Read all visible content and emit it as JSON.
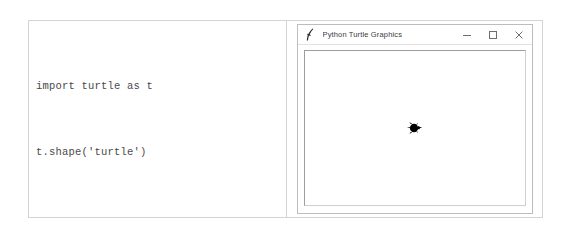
{
  "page": {
    "background_color": "#ffffff",
    "border_color": "#d4d4d4"
  },
  "code_panel": {
    "name": "code-listing",
    "language": "python",
    "lines": [
      "import turtle as t",
      "t.shape('turtle')"
    ],
    "text_color": "#4a4a4a"
  },
  "turtle_window": {
    "title": "Python Turtle Graphics",
    "icon": "python-feather-icon",
    "title_color": "#3c3c3c",
    "border_color": "#bdbdbd",
    "controls": {
      "minimize": {
        "name": "minimize-button",
        "glyph": "–",
        "tooltip": "Minimize"
      },
      "maximize": {
        "name": "maximize-button",
        "glyph": "□",
        "tooltip": "Maximize"
      },
      "close": {
        "name": "close-button",
        "glyph": "×",
        "tooltip": "Close"
      }
    },
    "canvas": {
      "name": "turtle-canvas",
      "background": "#ffffff",
      "border_color": "#9e9e9e",
      "sprite": {
        "name": "turtle-sprite",
        "shape": "turtle",
        "color": "#000000",
        "heading_degrees": 0,
        "position": {
          "x": 0,
          "y": 0
        }
      }
    }
  }
}
